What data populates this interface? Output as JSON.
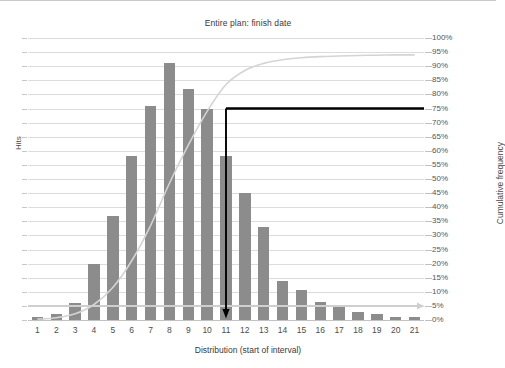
{
  "chart_data": {
    "type": "bar",
    "title": "Entire plan: finish date",
    "xlabel": "Distribution (start of interval)",
    "ylabel": "Hits",
    "y2label": "Cumulative frequency",
    "categories": [
      "1",
      "2",
      "3",
      "4",
      "5",
      "6",
      "7",
      "8",
      "9",
      "10",
      "11",
      "12",
      "13",
      "14",
      "15",
      "16",
      "17",
      "18",
      "19",
      "20",
      "21"
    ],
    "series": [
      {
        "name": "Hits",
        "type": "bar",
        "color": "#8c8c8c",
        "units": "percent-of-right-axis",
        "values": [
          1,
          2,
          6,
          20,
          37,
          58,
          76,
          91,
          82,
          75,
          58,
          45,
          33,
          14,
          10.5,
          6.5,
          5,
          3,
          2,
          1,
          1
        ]
      },
      {
        "name": "Cumulative frequency",
        "type": "line",
        "color": "#d4d4d4",
        "units": "percent",
        "values": [
          0.3,
          0.8,
          2.2,
          5.5,
          11.5,
          21.0,
          33.5,
          48.5,
          62.0,
          74.0,
          83.5,
          88.5,
          91.0,
          92.3,
          93.0,
          93.4,
          93.6,
          93.8,
          93.9,
          94.0,
          94.0
        ]
      }
    ],
    "y2ticks": [
      "0%",
      "5%",
      "10%",
      "15%",
      "20%",
      "25%",
      "30%",
      "35%",
      "40%",
      "45%",
      "50%",
      "55%",
      "60%",
      "65%",
      "70%",
      "75%",
      "80%",
      "85%",
      "90%",
      "95%",
      "100%"
    ],
    "y2lim": [
      0,
      100
    ],
    "grid": true,
    "legend": "none",
    "annotations": [
      {
        "name": "percentile-marker",
        "color": "#000000",
        "horizontal_level": "75%",
        "vertical_at_category": "11",
        "description": "Black horizontal line at 75% cumulative frequency joined to a vertical line dropping to the x-axis at interval 11 with a downward arrowhead."
      }
    ]
  },
  "axes": {
    "left_title": "Hits",
    "right_title": "Cumulative frequency",
    "x_title": "Distribution (start of interval)"
  },
  "header": {
    "title": "Entire plan: finish date"
  }
}
